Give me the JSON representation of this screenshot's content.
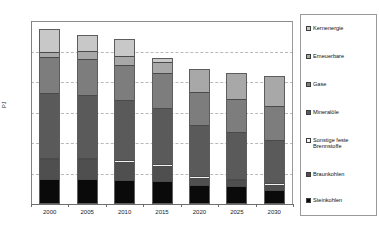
{
  "chart_data": {
    "type": "bar",
    "stacked": true,
    "title": "",
    "subtitle": "",
    "xlabel": "",
    "ylabel": "PJ",
    "categories": [
      "2000",
      "2005",
      "2010",
      "2015",
      "2020",
      "2025",
      "2030"
    ],
    "ylim": [
      0,
      15000
    ],
    "yticks": [
      0,
      2500,
      5000,
      7500,
      10000,
      12500,
      15000
    ],
    "ytick_labels": [
      "0",
      "2.500",
      "5.000",
      "7.500",
      "10.000",
      "12.500",
      "15.000"
    ],
    "grid": true,
    "legend_position": "right",
    "series": [
      {
        "name": "Steinkohlen",
        "color": "#0a0a0a",
        "values": [
          1980,
          1970,
          1870,
          1780,
          1500,
          1400,
          1070
        ]
      },
      {
        "name": "Braunkohlen",
        "color": "#4f4f4f",
        "values": [
          1620,
          1620,
          1490,
          1260,
          560,
          450,
          440
        ]
      },
      {
        "name": "Sonstige feste Brennstoffe",
        "color": "#f2f2f2",
        "values": [
          120,
          120,
          130,
          130,
          130,
          130,
          130
        ]
      },
      {
        "name": "Mineraloele",
        "color": "#5a5a5a",
        "values": [
          5340,
          5180,
          4960,
          4660,
          4230,
          3880,
          3540
        ]
      },
      {
        "name": "Gase",
        "color": "#7d7d7d",
        "values": [
          2910,
          2940,
          2860,
          2800,
          2700,
          2700,
          2800
        ]
      },
      {
        "name": "Erneuerbare",
        "color": "#a8a8a8",
        "values": [
          420,
          620,
          760,
          960,
          1980,
          2200,
          2520
        ]
      },
      {
        "name": "Kernenergie",
        "color": "#c8c8c8",
        "values": [
          1930,
          1430,
          1430,
          400,
          0,
          0,
          0
        ]
      }
    ],
    "legend": [
      {
        "label": "Kernenergie",
        "color": "#c8c8c8"
      },
      {
        "label": "Erneuerbare",
        "color": "#a8a8a8"
      },
      {
        "label": "Gase",
        "color": "#7d7d7d"
      },
      {
        "label": "Mineralöle",
        "color": "#5a5a5a"
      },
      {
        "label": "Sonstige feste\nBrennstoffe",
        "color": "#f2f2f2"
      },
      {
        "label": "Braunkohlen",
        "color": "#4f4f4f"
      },
      {
        "label": "Steinkohlen",
        "color": "#0a0a0a"
      }
    ]
  }
}
